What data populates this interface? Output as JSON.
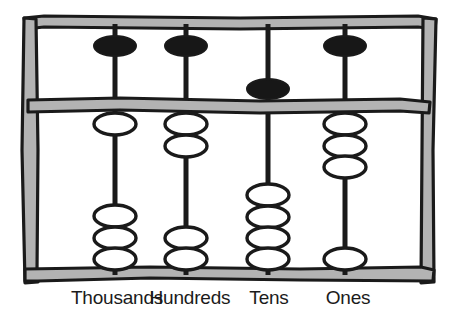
{
  "figure": {
    "kind": "abacus-illustration",
    "width": 459,
    "height": 322,
    "background_color": "#ffffff"
  },
  "colors": {
    "frame_fill": "#b3b3b3",
    "frame_stroke": "#1a1a1a",
    "rod_color": "#1a1a1a",
    "upper_bead_fill": "#171717",
    "lower_bead_fill": "#ffffff",
    "bead_stroke": "#1a1a1a",
    "label_color": "#1b1b1b"
  },
  "frame": {
    "left_post": "left-post",
    "right_post": "right-post",
    "top_rail": "top-rail",
    "bottom_rail": "bottom-rail",
    "divider_bar": "divider-bar"
  },
  "columns": [
    {
      "key": "thousands",
      "label": "Thousands",
      "place_value": 1000,
      "rod_x": 115,
      "label_x": 117,
      "upper_beads_total": 1,
      "upper_beads_active": 1,
      "lower_beads_total": 4,
      "lower_beads_active": 1,
      "digit": 6
    },
    {
      "key": "hundreds",
      "label": "Hundreds",
      "place_value": 100,
      "rod_x": 186,
      "label_x": 190,
      "upper_beads_total": 1,
      "upper_beads_active": 1,
      "lower_beads_total": 4,
      "lower_beads_active": 2,
      "digit": 7
    },
    {
      "key": "tens",
      "label": "Tens",
      "place_value": 10,
      "rod_x": 268,
      "label_x": 269,
      "upper_beads_total": 1,
      "upper_beads_active": 0,
      "lower_beads_total": 4,
      "lower_beads_active": 0,
      "digit": 0
    },
    {
      "key": "ones",
      "label": "Ones",
      "place_value": 1,
      "rod_x": 345,
      "label_x": 348,
      "upper_beads_total": 1,
      "upper_beads_active": 1,
      "lower_beads_total": 4,
      "lower_beads_active": 3,
      "digit": 8
    }
  ]
}
